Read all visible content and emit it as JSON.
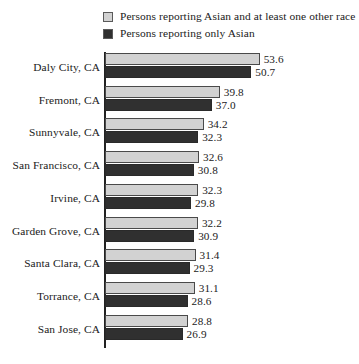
{
  "chart_data": {
    "type": "bar",
    "orientation": "horizontal",
    "title": "",
    "subtitle": "",
    "xlabel": "",
    "ylabel": "",
    "grid": false,
    "legend_position": "top",
    "xlim": [
      0,
      56
    ],
    "categories": [
      "Daly City, CA",
      "Fremont, CA",
      "Sunnyvale, CA",
      "San Francisco, CA",
      "Irvine, CA",
      "Garden Grove, CA",
      "Santa Clara, CA",
      "Torrance, CA",
      "San Jose, CA"
    ],
    "series": [
      {
        "name": "Persons reporting Asian and at least one other race",
        "color": "#d2d2d2",
        "values": [
          53.6,
          39.8,
          34.2,
          32.6,
          32.3,
          32.2,
          31.4,
          31.1,
          28.8
        ],
        "labels": [
          "53.6",
          "39.8",
          "34.2",
          "32.6",
          "32.3",
          "32.2",
          "31.4",
          "31.1",
          "28.8"
        ]
      },
      {
        "name": "Persons reporting only Asian",
        "color": "#303030",
        "values": [
          50.7,
          37.0,
          32.3,
          30.8,
          29.8,
          30.9,
          29.3,
          28.6,
          26.9
        ],
        "labels": [
          "50.7",
          "37.0",
          "32.3",
          "30.8",
          "29.8",
          "30.9",
          "29.3",
          "28.6",
          "26.9"
        ]
      }
    ]
  },
  "legend": {
    "items": [
      {
        "label": "Persons reporting Asian and at least one other race",
        "color": "#d2d2d2"
      },
      {
        "label": "Persons reporting only Asian",
        "color": "#303030"
      }
    ]
  }
}
